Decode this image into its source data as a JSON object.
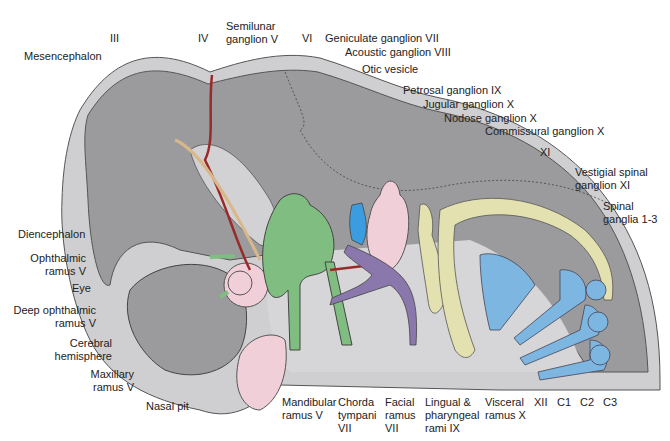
{
  "colors": {
    "background": "#ffffff",
    "outer_outline": "#cfcfd1",
    "brain": "#9b9b9d",
    "pharyngeal_region": "#d6d6d8",
    "trigeminal_green": "#7fbd80",
    "vagal_yellow": "#e3e1b0",
    "spinal_blue": "#7db6e1",
    "facial_purple": "#8a78ad",
    "acoustic_blue": "#3b9de0",
    "pink": "#f1cfd8",
    "trochlear_red": "#9a2a2a",
    "oculomotor_tan": "#d8b78a",
    "label_text": "#222222",
    "leader_line": "#555555"
  },
  "labels": {
    "top": [
      {
        "id": "III",
        "text": "III"
      },
      {
        "id": "IV",
        "text": "IV"
      },
      {
        "id": "semilunar",
        "text": "Semilunar\nganglion V"
      },
      {
        "id": "VI",
        "text": "VI"
      },
      {
        "id": "geniculate",
        "text": "Geniculate ganglion VII"
      },
      {
        "id": "acoustic",
        "text": "Acoustic ganglion VIII"
      },
      {
        "id": "otic",
        "text": "Otic vesicle"
      },
      {
        "id": "petrosal",
        "text": "Petrosal ganglion IX"
      },
      {
        "id": "jugular",
        "text": "Jugular ganglion X"
      },
      {
        "id": "nodose",
        "text": "Nodose ganglion X"
      },
      {
        "id": "commissural",
        "text": "Commissural ganglion X"
      },
      {
        "id": "XI",
        "text": "XI"
      },
      {
        "id": "vestigial",
        "text": "Vestigial spinal\nganglion XI"
      },
      {
        "id": "spinal",
        "text": "Spinal\nganglia 1-3"
      }
    ],
    "left": [
      {
        "id": "mesencephalon",
        "text": "Mesencephalon"
      },
      {
        "id": "diencephalon",
        "text": "Diencephalon"
      },
      {
        "id": "ophthalmic",
        "text": "Ophthalmic\nramus V"
      },
      {
        "id": "eye",
        "text": "Eye"
      },
      {
        "id": "deep_ophthalmic",
        "text": "Deep ophthalmic\nramus V"
      },
      {
        "id": "cerebral",
        "text": "Cerebral\nhemisphere"
      },
      {
        "id": "maxillary",
        "text": "Maxillary\nramus V"
      },
      {
        "id": "nasal",
        "text": "Nasal pit"
      }
    ],
    "bottom": [
      {
        "id": "mandibular",
        "text": "Mandibular\nramus V"
      },
      {
        "id": "chorda",
        "text": "Chorda\ntympani\nVII"
      },
      {
        "id": "facial",
        "text": "Facial\nramus\nVII"
      },
      {
        "id": "lingual",
        "text": "Lingual &\npharyngeal\nrami IX"
      },
      {
        "id": "visceral",
        "text": "Visceral\nramus X"
      },
      {
        "id": "XII",
        "text": "XII"
      },
      {
        "id": "C1",
        "text": "C1"
      },
      {
        "id": "C2",
        "text": "C2"
      },
      {
        "id": "C3",
        "text": "C3"
      }
    ]
  }
}
